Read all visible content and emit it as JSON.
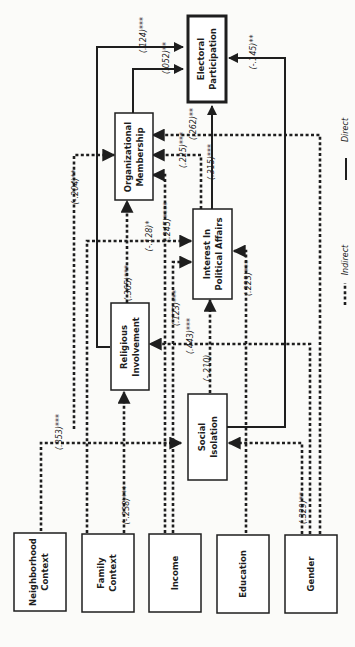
{
  "diagram": {
    "orientation": "rotated-90-ccw",
    "nodes": {
      "neighborhood": {
        "label_1": "Neighborhood",
        "label_2": "Context"
      },
      "family": {
        "label_1": "Family",
        "label_2": "Context"
      },
      "income": {
        "label_1": "Income"
      },
      "education": {
        "label_1": "Education"
      },
      "gender": {
        "label_1": "Gender"
      },
      "social_isolation": {
        "label_1": "Social",
        "label_2": "Isolation"
      },
      "religious": {
        "label_1": "Religious",
        "label_2": "Involvement"
      },
      "interest": {
        "label_1": "Interest In",
        "label_2": "Political Affairs"
      },
      "organizational": {
        "label_1": "Organizational",
        "label_2": "Membership"
      },
      "electoral": {
        "label_1": "Electoral",
        "label_2": "Participation"
      }
    },
    "edges": [
      {
        "from": "Neighborhood Context",
        "to": "Social Isolation",
        "coef": "(.353)***",
        "type": "indirect"
      },
      {
        "from": "Family Context",
        "to": "Religious Involvement",
        "coef": "(-.238)***",
        "type": "indirect"
      },
      {
        "from": "Gender",
        "to": "Social Isolation",
        "coef": "(.329)**",
        "type": "indirect"
      },
      {
        "from": "Social Isolation",
        "to": "Interest In Political Affairs",
        "coef": "(-.210)",
        "type": "indirect"
      },
      {
        "from": "Gender",
        "to": "Religious Involvement",
        "coef": "(.443)***",
        "type": "indirect"
      },
      {
        "from": "Income",
        "to": "Interest In Political Affairs",
        "coef": "(.123)***",
        "type": "indirect"
      },
      {
        "from": "Education",
        "to": "Interest In Political Affairs",
        "coef": "(.223)***",
        "type": "indirect"
      },
      {
        "from": "Religious Involvement",
        "to": "Organizational Membership",
        "coef": "(.365)***",
        "type": "indirect"
      },
      {
        "from": "Family Context",
        "to": "Interest In Political Affairs",
        "coef": "(-.128)*",
        "type": "indirect"
      },
      {
        "from": "Income",
        "to": "Organizational Membership",
        "coef": "(.245)****",
        "type": "indirect"
      },
      {
        "from": "Neighborhood Context",
        "to": "Organizational Membership",
        "coef": "(-.204)**",
        "type": "indirect"
      },
      {
        "from": "Interest In Political Affairs",
        "to": "Organizational Membership",
        "coef": "(.225)***",
        "type": "indirect"
      },
      {
        "from": "Gender",
        "to": "Organizational Membership",
        "coef": "(.262)**",
        "type": "indirect"
      },
      {
        "from": "Interest In Political Affairs",
        "to": "Electoral Participation",
        "coef": "(.315)***",
        "type": "direct"
      },
      {
        "from": "Religious Involvement",
        "to": "Electoral Participation",
        "coef": "(.124)***",
        "type": "direct"
      },
      {
        "from": "Organizational Membership",
        "to": "Electoral Participation",
        "coef": "(.052)**",
        "type": "direct"
      },
      {
        "from": "Social Isolation",
        "to": "Electoral Participation",
        "coef": "(-.145)**",
        "type": "direct"
      }
    ],
    "coef": {
      "c353": "(.353)***",
      "c238": "(-.238)***",
      "c329": "(.329)**",
      "c210": "(-.210)",
      "c443": "(.443)***",
      "c123": "(.123)***",
      "c223": "(.223)***",
      "c365": "(.365)***",
      "c128": "(-.128)*",
      "c245": "(.245)****",
      "c204": "(-.204)**",
      "c225": "(.225)***",
      "c262": "(.262)**",
      "c315": "(.315)***",
      "c124": "(.124)***",
      "c052": "(.052)**",
      "c145": "(-.145)**"
    },
    "legend": {
      "indirect": "Indirect",
      "direct": "Direct"
    }
  }
}
